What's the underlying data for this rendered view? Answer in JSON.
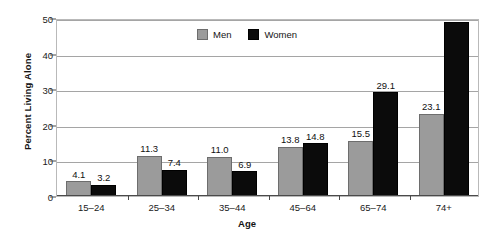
{
  "chart_data": {
    "type": "bar",
    "title": "",
    "xlabel": "Age",
    "ylabel": "Percent Living Alone",
    "ylim": [
      0,
      50
    ],
    "yticks": [
      "0",
      "10",
      "20",
      "30",
      "40",
      "50"
    ],
    "grid": true,
    "legend_position": "top-center",
    "categories": [
      "15–24",
      "25–34",
      "35–44",
      "45–64",
      "65–74",
      "74+"
    ],
    "series": [
      {
        "name": "Men",
        "color": "#9b9b9b",
        "values": [
          4.1,
          11.3,
          11.0,
          13.8,
          15.5,
          23.1
        ],
        "labels": [
          "4.1",
          "11.3",
          "11.0",
          "13.8",
          "15.5",
          "23.1"
        ]
      },
      {
        "name": "Women",
        "color": "#0b0b0b",
        "values": [
          3.2,
          7.4,
          6.9,
          14.8,
          29.1,
          49.0
        ],
        "labels": [
          "3.2",
          "7.4",
          "6.9",
          "14.8",
          "29.1",
          ""
        ]
      }
    ]
  },
  "legend": {
    "men_label": "Men",
    "women_label": "Women"
  },
  "axes": {
    "y_title": "Percent Living Alone",
    "x_title": "Age"
  }
}
